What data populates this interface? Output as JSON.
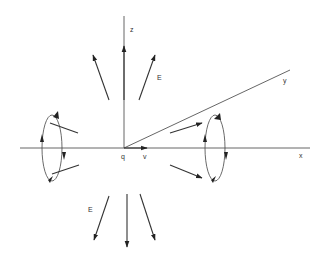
{
  "diagram": {
    "title": "",
    "colors": {
      "line": "#333333",
      "background": "#ffffff"
    },
    "axes": {
      "x_label": "x",
      "y_label": "y",
      "z_label": "z"
    },
    "charge_label": "q",
    "velocity_label": "v",
    "field_labels": {
      "upper_E": "E",
      "lower_E": "E"
    },
    "upper_field_arrows": 3,
    "lower_field_arrows": 3,
    "magnetic_loops": 2
  }
}
